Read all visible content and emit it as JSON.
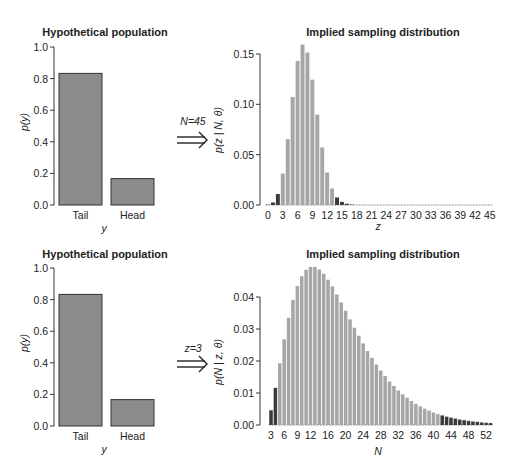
{
  "colors": {
    "bar": "#8c8c8c",
    "bar_stroke": "#333333",
    "light_bar": "#a6a6a6",
    "dark_bar": "#3a3a3a",
    "axis": "#333333"
  },
  "chart_data": [
    {
      "type": "bar",
      "title": "Hypothetical population",
      "xlabel": "y",
      "ylabel": "p(y)",
      "categories": [
        "Tail",
        "Head"
      ],
      "values": [
        0.833,
        0.167
      ],
      "ylim": [
        0,
        1.0
      ],
      "yticks": [
        "0.0",
        "0.2",
        "0.4",
        "0.6",
        "0.8",
        "1.0"
      ]
    },
    {
      "type": "bar",
      "title": "Implied sampling distribution",
      "annotation": "N=45",
      "xlabel": "z",
      "ylabel": "p(z | N, θ)",
      "ylim": [
        0,
        0.15
      ],
      "yticks": [
        "0.00",
        "0.05",
        "0.10",
        "0.15"
      ],
      "xticks": [
        "0",
        "3",
        "6",
        "9",
        "12",
        "15",
        "18",
        "21",
        "24",
        "27",
        "30",
        "33",
        "36",
        "39",
        "42",
        "45"
      ],
      "x": [
        0,
        1,
        2,
        3,
        4,
        5,
        6,
        7,
        8,
        9,
        10,
        11,
        12,
        13,
        14,
        15,
        16,
        17,
        18,
        19,
        20,
        21,
        22,
        23,
        24,
        25,
        26,
        27,
        28,
        29,
        30,
        31,
        32,
        33,
        34,
        35,
        36,
        37,
        38,
        39,
        40,
        41,
        42,
        43,
        44,
        45
      ],
      "values": [
        0.0003,
        0.0025,
        0.0109,
        0.0312,
        0.0654,
        0.1073,
        0.1431,
        0.1594,
        0.1514,
        0.1245,
        0.0897,
        0.0571,
        0.0323,
        0.0164,
        0.0075,
        0.0031,
        0.0012,
        0.0004,
        0.0001,
        0,
        0,
        0,
        0,
        0,
        0,
        0,
        0,
        0,
        0,
        0,
        0,
        0,
        0,
        0,
        0,
        0,
        0,
        0,
        0,
        0,
        0,
        0,
        0,
        0,
        0,
        0
      ],
      "tail_dark_low_max": 2,
      "tail_dark_high_min": 14
    },
    {
      "type": "bar",
      "title": "Hypothetical population",
      "xlabel": "y",
      "ylabel": "p(y)",
      "categories": [
        "Tail",
        "Head"
      ],
      "values": [
        0.833,
        0.167
      ],
      "ylim": [
        0,
        1.0
      ],
      "yticks": [
        "0.0",
        "0.2",
        "0.4",
        "0.6",
        "0.8",
        "1.0"
      ]
    },
    {
      "type": "bar",
      "title": "Implied sampling distribution",
      "annotation": "z=3",
      "xlabel": "N",
      "ylabel": "p(N | z, θ)",
      "ylim": [
        0,
        0.04
      ],
      "yticks": [
        "0.00",
        "0.01",
        "0.02",
        "0.03",
        "0.04"
      ],
      "xticks": [
        "3",
        "6",
        "9",
        "12",
        "16",
        "20",
        "24",
        "28",
        "32",
        "36",
        "40",
        "44",
        "48",
        "52"
      ],
      "xtick_positions": [
        3,
        6,
        9,
        12,
        16,
        20,
        24,
        28,
        32,
        36,
        40,
        44,
        48,
        52
      ],
      "x": [
        3,
        4,
        5,
        6,
        7,
        8,
        9,
        10,
        11,
        12,
        13,
        14,
        15,
        16,
        17,
        18,
        19,
        20,
        21,
        22,
        23,
        24,
        25,
        26,
        27,
        28,
        29,
        30,
        31,
        32,
        33,
        34,
        35,
        36,
        37,
        38,
        39,
        40,
        41,
        42,
        43,
        44,
        45,
        46,
        47,
        48,
        49,
        50,
        51,
        52,
        53
      ],
      "values": [
        0.0046,
        0.0116,
        0.0193,
        0.0268,
        0.0335,
        0.0391,
        0.0434,
        0.0465,
        0.0485,
        0.0494,
        0.0494,
        0.0486,
        0.0473,
        0.0454,
        0.0433,
        0.0408,
        0.0383,
        0.0357,
        0.033,
        0.0304,
        0.0279,
        0.0255,
        0.0231,
        0.021,
        0.0189,
        0.017,
        0.0153,
        0.0136,
        0.0122,
        0.0108,
        0.0096,
        0.0085,
        0.0075,
        0.0066,
        0.0058,
        0.0051,
        0.0045,
        0.0039,
        0.0034,
        0.003,
        0.0026,
        0.0023,
        0.002,
        0.0017,
        0.0015,
        0.0013,
        0.0011,
        0.001,
        0.0008,
        0.0007,
        0.0006
      ],
      "tail_dark_low_max": 4,
      "tail_dark_high_min": 42
    }
  ]
}
